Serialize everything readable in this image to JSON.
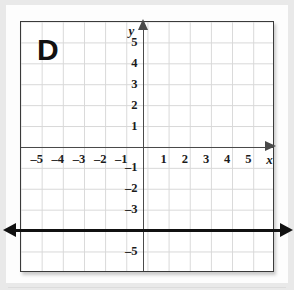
{
  "figure": {
    "panel_label": "D",
    "axis_label_x": "x",
    "axis_label_y": "y"
  },
  "axes": {
    "x_ticks": [
      {
        "value": -5,
        "label": "–5"
      },
      {
        "value": -4,
        "label": "–4"
      },
      {
        "value": -3,
        "label": "–3"
      },
      {
        "value": -2,
        "label": "–2"
      },
      {
        "value": -1,
        "label": "–1"
      },
      {
        "value": 1,
        "label": "1"
      },
      {
        "value": 2,
        "label": "2"
      },
      {
        "value": 3,
        "label": "3"
      },
      {
        "value": 4,
        "label": "4"
      },
      {
        "value": 5,
        "label": "5"
      }
    ],
    "y_ticks": [
      {
        "value": 5,
        "label": "5"
      },
      {
        "value": 4,
        "label": "4"
      },
      {
        "value": 3,
        "label": "3"
      },
      {
        "value": 2,
        "label": "2"
      },
      {
        "value": 1,
        "label": "1"
      },
      {
        "value": -1,
        "label": "–1"
      },
      {
        "value": -2,
        "label": "–2"
      },
      {
        "value": -3,
        "label": "–3"
      },
      {
        "value": -5,
        "label": "–5"
      }
    ]
  },
  "chart_data": {
    "type": "line",
    "title": "D",
    "xlabel": "x",
    "ylabel": "y",
    "xlim": [
      -6,
      6
    ],
    "ylim": [
      -6,
      6
    ],
    "grid": true,
    "legend": "none",
    "series": [
      {
        "name": "y = -4",
        "equation": "y = -4",
        "orientation": "horizontal",
        "y_intercept": -4,
        "slope": 0,
        "arrows": "both",
        "color": "#111111",
        "points": [
          {
            "x": -6,
            "y": -4
          },
          {
            "x": 6,
            "y": -4
          }
        ]
      }
    ],
    "x_tick_values": [
      -5,
      -4,
      -3,
      -2,
      -1,
      1,
      2,
      3,
      4,
      5
    ],
    "y_tick_values": [
      5,
      4,
      3,
      2,
      1,
      -1,
      -2,
      -3,
      -5
    ]
  },
  "colors": {
    "line": "#111111",
    "axis": "#4a4a4a",
    "grid": "#d8d8d8",
    "border": "#3a3a3a",
    "page": "#fdfdfd",
    "background": "#e9e9e9"
  }
}
